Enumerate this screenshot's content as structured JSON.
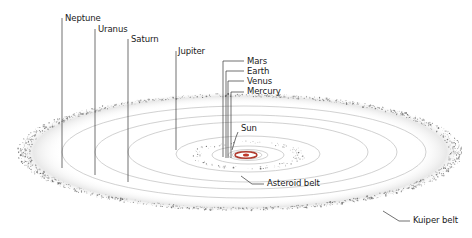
{
  "diagram": {
    "type": "solar-system-orbits",
    "labels": {
      "neptune": "Neptune",
      "uranus": "Uranus",
      "saturn": "Saturn",
      "jupiter": "Jupiter",
      "mars": "Mars",
      "earth": "Earth",
      "venus": "Venus",
      "mercury": "Mercury",
      "sun": "Sun",
      "asteroid_belt": "Asteroid belt",
      "kuiper_belt": "Kuiper belt"
    },
    "colors": {
      "orbit": "#b8b8b8",
      "leader": "#333333",
      "sun": "#c0392b",
      "belt_dots": "#555555",
      "text": "#1a1a1a"
    }
  }
}
